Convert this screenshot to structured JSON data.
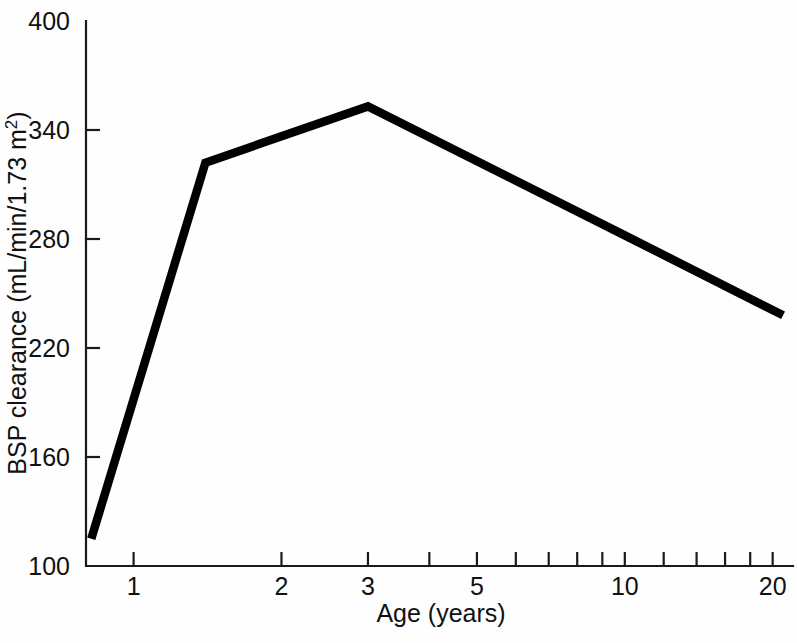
{
  "chart_data": {
    "type": "line",
    "title": "",
    "xlabel": "Age (years)",
    "ylabel": "BSP clearance (mL/min/1.73 m",
    "ylabel_superscript": "2",
    "ylabel_suffix": ")",
    "xscale": "log",
    "yscale": "linear",
    "xlim": [
      0.8,
      22
    ],
    "ylim": [
      100,
      400
    ],
    "grid": false,
    "legend": null,
    "x_ticks_major": [
      {
        "value": 1,
        "label": "1"
      },
      {
        "value": 2,
        "label": "2"
      },
      {
        "value": 3,
        "label": "3"
      },
      {
        "value": 5,
        "label": "5"
      },
      {
        "value": 10,
        "label": "10"
      },
      {
        "value": 20,
        "label": "20"
      }
    ],
    "x_ticks_minor": [
      1,
      2,
      3,
      4,
      5,
      6,
      7,
      8,
      9,
      10,
      12,
      14,
      16,
      18,
      20
    ],
    "y_ticks": [
      {
        "value": 100,
        "label": "100"
      },
      {
        "value": 160,
        "label": "160"
      },
      {
        "value": 220,
        "label": "220"
      },
      {
        "value": 280,
        "label": "280"
      },
      {
        "value": 340,
        "label": "340"
      },
      {
        "value": 400,
        "label": "400"
      }
    ],
    "series": [
      {
        "name": "BSP clearance",
        "color": "#000000",
        "x": [
          0.82,
          1.4,
          3.0,
          10.0,
          21.0
        ],
        "values": [
          115,
          322,
          353,
          282,
          238
        ]
      }
    ]
  },
  "figure": {
    "background_color": "#fefefe",
    "axis_color": "#1a1a1a",
    "line_color": "#000000"
  }
}
